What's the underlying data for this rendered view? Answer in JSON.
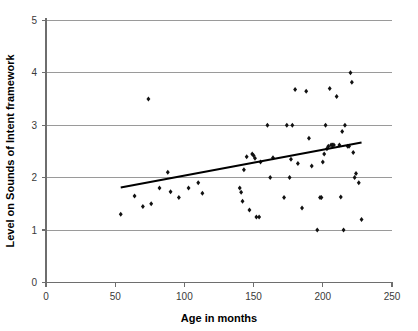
{
  "chart_data": {
    "type": "scatter",
    "title": "",
    "xlabel": "Age in months",
    "ylabel": "Level on Sounds of Intent framework",
    "xlim": [
      0,
      250
    ],
    "ylim": [
      0,
      5
    ],
    "xticks": [
      0,
      50,
      100,
      150,
      200,
      250
    ],
    "yticks": [
      0,
      1,
      2,
      3,
      4,
      5
    ],
    "grid": "horizontal",
    "legend": "none",
    "marker": "diamond",
    "marker_color": "#111111",
    "trendline": {
      "type": "linear",
      "color": "#000000",
      "x_start": 54,
      "y_start": 1.81,
      "x_end": 228,
      "y_end": 2.67
    },
    "points": [
      {
        "x": 54,
        "y": 1.3
      },
      {
        "x": 64,
        "y": 1.65
      },
      {
        "x": 70,
        "y": 1.45
      },
      {
        "x": 74,
        "y": 3.5
      },
      {
        "x": 76,
        "y": 1.5
      },
      {
        "x": 82,
        "y": 1.8
      },
      {
        "x": 88,
        "y": 2.1
      },
      {
        "x": 90,
        "y": 1.73
      },
      {
        "x": 96,
        "y": 1.62
      },
      {
        "x": 103,
        "y": 1.8
      },
      {
        "x": 110,
        "y": 1.9
      },
      {
        "x": 113,
        "y": 1.7
      },
      {
        "x": 140,
        "y": 1.8
      },
      {
        "x": 141,
        "y": 1.72
      },
      {
        "x": 142,
        "y": 1.55
      },
      {
        "x": 143,
        "y": 2.15
      },
      {
        "x": 145,
        "y": 2.4
      },
      {
        "x": 147,
        "y": 1.38
      },
      {
        "x": 149,
        "y": 2.45
      },
      {
        "x": 150,
        "y": 2.42
      },
      {
        "x": 151,
        "y": 2.37
      },
      {
        "x": 152,
        "y": 1.25
      },
      {
        "x": 154,
        "y": 1.25
      },
      {
        "x": 155,
        "y": 2.3
      },
      {
        "x": 160,
        "y": 3.0
      },
      {
        "x": 162,
        "y": 2.0
      },
      {
        "x": 164,
        "y": 2.38
      },
      {
        "x": 172,
        "y": 1.62
      },
      {
        "x": 174,
        "y": 3.0
      },
      {
        "x": 176,
        "y": 2.0
      },
      {
        "x": 177,
        "y": 2.35
      },
      {
        "x": 178,
        "y": 3.0
      },
      {
        "x": 180,
        "y": 3.68
      },
      {
        "x": 182,
        "y": 2.27
      },
      {
        "x": 185,
        "y": 1.42
      },
      {
        "x": 188,
        "y": 3.65
      },
      {
        "x": 190,
        "y": 2.75
      },
      {
        "x": 192,
        "y": 2.22
      },
      {
        "x": 196,
        "y": 1.0
      },
      {
        "x": 198,
        "y": 1.62
      },
      {
        "x": 199,
        "y": 1.62
      },
      {
        "x": 200,
        "y": 2.3
      },
      {
        "x": 201,
        "y": 2.45
      },
      {
        "x": 202,
        "y": 3.0
      },
      {
        "x": 203,
        "y": 2.55
      },
      {
        "x": 204,
        "y": 2.6
      },
      {
        "x": 205,
        "y": 3.7
      },
      {
        "x": 206,
        "y": 2.62
      },
      {
        "x": 207,
        "y": 2.62
      },
      {
        "x": 208,
        "y": 2.62
      },
      {
        "x": 210,
        "y": 3.55
      },
      {
        "x": 212,
        "y": 2.62
      },
      {
        "x": 213,
        "y": 1.63
      },
      {
        "x": 214,
        "y": 2.88
      },
      {
        "x": 215,
        "y": 1.0
      },
      {
        "x": 216,
        "y": 3.0
      },
      {
        "x": 218,
        "y": 2.6
      },
      {
        "x": 219,
        "y": 2.6
      },
      {
        "x": 220,
        "y": 4.0
      },
      {
        "x": 221,
        "y": 3.82
      },
      {
        "x": 222,
        "y": 2.48
      },
      {
        "x": 223,
        "y": 2.0
      },
      {
        "x": 224,
        "y": 2.08
      },
      {
        "x": 226,
        "y": 1.9
      },
      {
        "x": 228,
        "y": 1.2
      }
    ]
  },
  "axes": {
    "y_title": "Level on Sounds of Intent framework",
    "x_title": "Age in months",
    "y_tick_labels": [
      "0",
      "1",
      "2",
      "3",
      "4",
      "5"
    ],
    "x_tick_labels": [
      "0",
      "50",
      "100",
      "150",
      "200",
      "250"
    ],
    "origin_label": "0"
  }
}
